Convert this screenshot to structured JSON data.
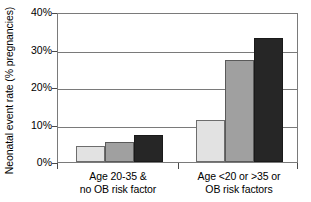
{
  "chart_data": {
    "type": "bar",
    "title": "",
    "xlabel": "",
    "ylabel": "Neonatal event rate (% pregnancies)",
    "ylim": [
      0,
      40
    ],
    "yticks": [
      "0%",
      "10%",
      "20%",
      "30%",
      "40%"
    ],
    "ytick_values": [
      0,
      10,
      20,
      30,
      40
    ],
    "grid": true,
    "legend": "none",
    "categories": [
      "Age 20-35 &\nno OB risk factor",
      "Age <20 or >35 or\nOB risk factors"
    ],
    "category_lines": [
      [
        "Age 20-35 &",
        "no OB risk factor"
      ],
      [
        "Age <20 or >35 or",
        "OB risk factors"
      ]
    ],
    "series": [
      {
        "name": "series-1",
        "color": "#e2e2e2",
        "values": [
          4.3,
          11.1
        ]
      },
      {
        "name": "series-2",
        "color": "#a0a0a0",
        "values": [
          5.3,
          27.2
        ]
      },
      {
        "name": "series-3",
        "color": "#262626",
        "values": [
          7.3,
          33.0
        ]
      }
    ]
  },
  "axis": {
    "y_title": "Neonatal event rate (% pregnancies)"
  }
}
